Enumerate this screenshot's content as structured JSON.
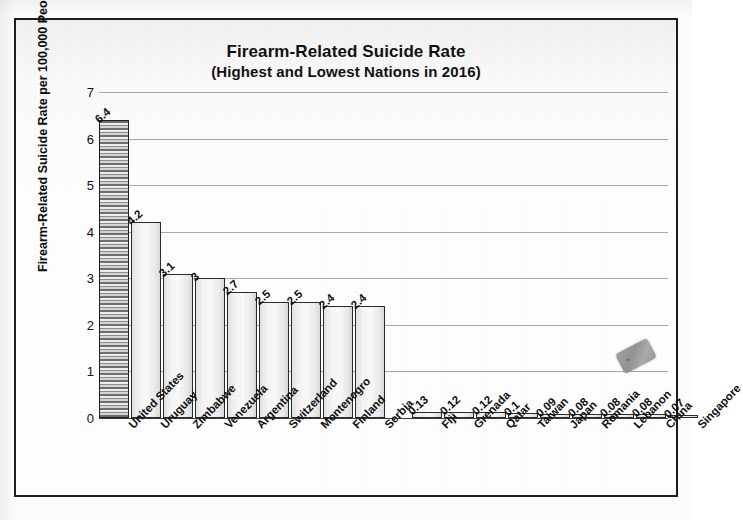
{
  "chart_data": {
    "type": "bar",
    "title": "Firearm-Related Suicide Rate",
    "subtitle": "(Highest and Lowest Nations in 2016)",
    "xlabel": "",
    "ylabel": "Firearm-Related Suicide Rate per 100,000 People",
    "ylim": [
      0,
      7
    ],
    "grid": true,
    "legend": "none",
    "y_ticks": [
      "0",
      "1",
      "2",
      "3",
      "4",
      "5",
      "6",
      "7"
    ],
    "y_tick_values": [
      0,
      1,
      2,
      3,
      4,
      5,
      6,
      7
    ],
    "groups": [
      {
        "name": "Highest Nations",
        "categories": [
          "United States",
          "Uruguay",
          "Zimbabwe",
          "Venezuela",
          "Argentina",
          "Switzerland",
          "Montenegro",
          "Finland",
          "Serbia"
        ],
        "values": [
          6.4,
          4.2,
          3.1,
          3,
          2.7,
          2.5,
          2.5,
          2.4,
          2.4
        ],
        "value_labels": [
          "6.4",
          "4.2",
          "3.1",
          "3",
          "2.7",
          "2.5",
          "2.5",
          "2.4",
          "2.4"
        ]
      },
      {
        "name": "Lowest Nations",
        "categories": [
          "Fiji",
          "Grenada",
          "Qatar",
          "Taiwan",
          "Japan",
          "Romania",
          "Lebanon",
          "China",
          "Singapore"
        ],
        "values": [
          0.13,
          0.12,
          0.12,
          0.1,
          0.09,
          0.08,
          0.08,
          0.08,
          0.07
        ],
        "value_labels": [
          "0.13",
          "0.12",
          "0.12",
          "0.1",
          "0.09",
          "0.08",
          "0.08",
          "0.08",
          "0.07"
        ]
      }
    ],
    "categories": [
      "United States",
      "Uruguay",
      "Zimbabwe",
      "Venezuela",
      "Argentina",
      "Switzerland",
      "Montenegro",
      "Finland",
      "Serbia",
      "Fiji",
      "Grenada",
      "Qatar",
      "Taiwan",
      "Japan",
      "Romania",
      "Lebanon",
      "China",
      "Singapore"
    ],
    "values": [
      6.4,
      4.2,
      3.1,
      3,
      2.7,
      2.5,
      2.5,
      2.4,
      2.4,
      0.13,
      0.12,
      0.12,
      0.1,
      0.09,
      0.08,
      0.08,
      0.08,
      0.07
    ],
    "colors": {
      "bar_fill": "#f2f2f2",
      "bar_border": "#2a2a2a",
      "highlight_bar_pattern": "#6f6f6f",
      "gridline": "#a9a9a9",
      "axis": "#3a3a3a",
      "text": "#0f0f0f",
      "frame": "#1d1d1d",
      "background": "#ffffff",
      "smudge": "#9a9a9a"
    },
    "annotations": [
      {
        "name": "scan-smudge",
        "description": "gray rotated rounded-rectangle scanning artifact above the China bar",
        "near_category": "China"
      }
    ]
  }
}
